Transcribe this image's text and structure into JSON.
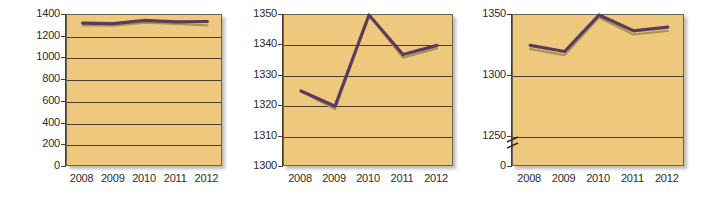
{
  "figure": {
    "background_color": "#ffffff",
    "panel_background": "#eec97d",
    "axis_color": "#4a3c28",
    "series_colors": {
      "primary": "#5c3a5e",
      "secondary": "#a89450"
    }
  },
  "chart_data": [
    {
      "type": "line",
      "title": "",
      "xlabel": "",
      "ylabel": "",
      "categories": [
        "2008",
        "2009",
        "2010",
        "2011",
        "2012"
      ],
      "x": [
        2008,
        2009,
        2010,
        2011,
        2012
      ],
      "ylim": [
        0,
        1400
      ],
      "yticks": [
        0,
        200,
        400,
        600,
        800,
        1000,
        1200,
        1400
      ],
      "ytick_labels": [
        "0",
        "200",
        "400",
        "600",
        "800",
        "1000",
        "1200",
        "1400"
      ],
      "grid": true,
      "legend": "none",
      "axis_break": false,
      "series": [
        {
          "name": "primary",
          "color": "#5c3a5e",
          "values": [
            1325,
            1320,
            1350,
            1337,
            1340
          ]
        },
        {
          "name": "secondary",
          "color": "#a89450",
          "values": [
            1305,
            1302,
            1330,
            1318,
            1305
          ]
        }
      ]
    },
    {
      "type": "line",
      "title": "",
      "xlabel": "",
      "ylabel": "",
      "categories": [
        "2008",
        "2009",
        "2010",
        "2011",
        "2012"
      ],
      "x": [
        2008,
        2009,
        2010,
        2011,
        2012
      ],
      "ylim": [
        1300,
        1350
      ],
      "yticks": [
        1300,
        1310,
        1320,
        1330,
        1340,
        1350
      ],
      "ytick_labels": [
        "1300",
        "1310",
        "1320",
        "1330",
        "1340",
        "1350"
      ],
      "grid": true,
      "legend": "none",
      "axis_break": false,
      "series": [
        {
          "name": "primary",
          "color": "#5c3a5e",
          "values": [
            1325,
            1320,
            1350,
            1337,
            1340
          ]
        },
        {
          "name": "secondary",
          "color": "#a89450",
          "values": [
            1325,
            1319,
            1350,
            1336,
            1339
          ]
        }
      ]
    },
    {
      "type": "line",
      "title": "",
      "xlabel": "",
      "ylabel": "",
      "categories": [
        "2008",
        "2009",
        "2010",
        "2011",
        "2012"
      ],
      "x": [
        2008,
        2009,
        2010,
        2011,
        2012
      ],
      "ylim": [
        1225,
        1350
      ],
      "yticks": [
        0,
        1250,
        1300,
        1350
      ],
      "ytick_labels": [
        "0",
        "1250",
        "1300",
        "1350"
      ],
      "grid": true,
      "legend": "none",
      "axis_break": true,
      "axis_break_note": "zigzag break between 0 and 1250",
      "series": [
        {
          "name": "primary",
          "color": "#5c3a5e",
          "values": [
            1325,
            1320,
            1350,
            1337,
            1340
          ]
        },
        {
          "name": "secondary",
          "color": "#a89450",
          "values": [
            1322,
            1317,
            1348,
            1334,
            1337
          ]
        }
      ]
    }
  ]
}
